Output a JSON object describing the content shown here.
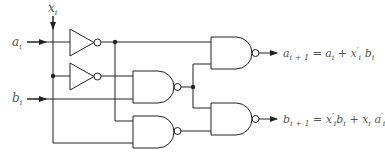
{
  "diagram": {
    "type": "logic-circuit",
    "inputs": [
      {
        "id": "x",
        "label": "x",
        "sub": "i"
      },
      {
        "id": "a",
        "label": "a",
        "sub": "i"
      },
      {
        "id": "b",
        "label": "b",
        "sub": "i"
      }
    ],
    "gates": [
      {
        "id": "inv1",
        "kind": "NOT",
        "input": "a_i"
      },
      {
        "id": "inv2",
        "kind": "NOT",
        "input": "x_i"
      },
      {
        "id": "nand_mid",
        "kind": "NAND",
        "inputs": [
          "x_i'",
          "b_i"
        ]
      },
      {
        "id": "nand_low",
        "kind": "NAND",
        "inputs": [
          "a_i'",
          "x_i"
        ]
      },
      {
        "id": "nand_out_a",
        "kind": "NAND",
        "inputs": [
          "a_i'",
          "nand_mid"
        ]
      },
      {
        "id": "nand_out_b",
        "kind": "NAND",
        "inputs": [
          "nand_mid",
          "nand_low"
        ]
      }
    ],
    "outputs": [
      {
        "id": "a_next",
        "lhs": "a",
        "lhs_sub": "i + 1",
        "eq": "=",
        "t1": "a",
        "t1_sub": "i",
        "plus": "+",
        "t2": "x",
        "t2_prime": "′",
        "t2_sub": "i",
        "t3": "b",
        "t3_sub": "i"
      },
      {
        "id": "b_next",
        "lhs": "b",
        "lhs_sub": "i + 1",
        "eq": "=",
        "t1": "x",
        "t1_prime": "′",
        "t1_sub": "i",
        "t2": "b",
        "t2_sub": "i",
        "plus": "+",
        "t3": "x",
        "t3_sub": "i",
        "t4": "a",
        "t4_prime": "′",
        "t4_sub": "i"
      }
    ],
    "colors": {
      "wire": "#222222",
      "label": "#555555",
      "background": "#ffffff"
    }
  }
}
